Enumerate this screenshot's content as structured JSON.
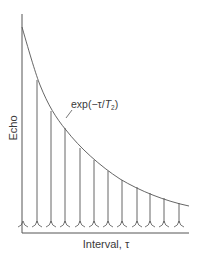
{
  "diagram": {
    "y_axis_label": "Echo",
    "x_axis_label": "Interval, τ",
    "curve_label": {
      "prefix": "exp(−τ/",
      "T": "T",
      "sub": "2",
      "suffix": ")"
    },
    "colors": {
      "line": "#555555",
      "text": "#3a3a3a",
      "background": "#ffffff"
    },
    "echo_count": 12,
    "echoes": [
      {
        "x": 23,
        "top": 227
      },
      {
        "x": 37,
        "top": 80
      },
      {
        "x": 51,
        "top": 111
      },
      {
        "x": 65,
        "top": 128
      },
      {
        "x": 80,
        "top": 148
      },
      {
        "x": 94,
        "top": 160
      },
      {
        "x": 108,
        "top": 171
      },
      {
        "x": 122,
        "top": 180
      },
      {
        "x": 137,
        "top": 187
      },
      {
        "x": 150,
        "top": 193
      },
      {
        "x": 164,
        "top": 198
      },
      {
        "x": 179,
        "top": 203
      }
    ]
  }
}
